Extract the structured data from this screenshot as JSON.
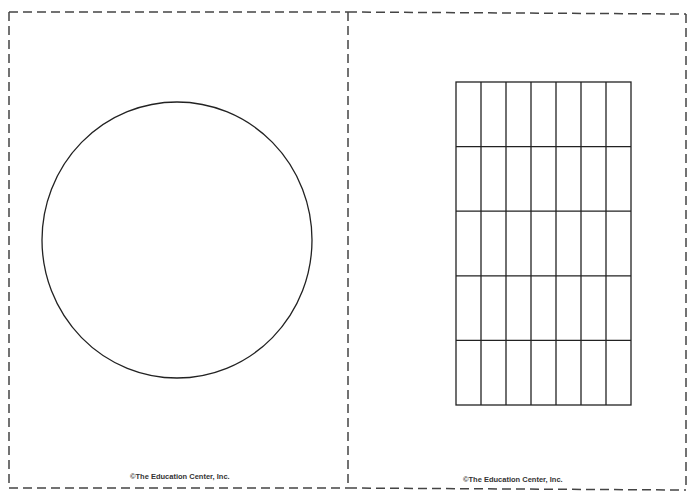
{
  "cards": [
    {
      "id": "left",
      "shape": "circle",
      "credit": "©The Education Center, Inc."
    },
    {
      "id": "right",
      "shape": "grid",
      "grid": {
        "columns": 7,
        "rows": 5
      },
      "credit": "©The Education Center, Inc."
    }
  ],
  "colors": {
    "line": "#222222",
    "dash": "#444444",
    "background": "#ffffff"
  }
}
